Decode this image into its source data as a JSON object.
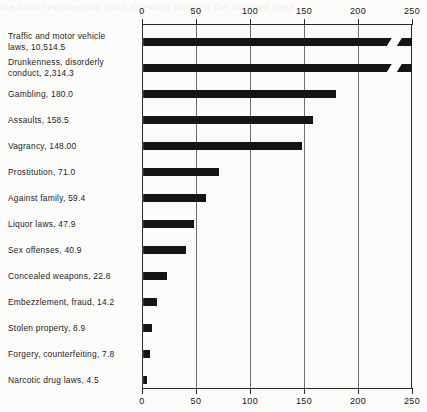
{
  "scan": {
    "bleed_text": "the faint reverse-side print showing through the scanned page"
  },
  "chart_data": {
    "type": "bar",
    "orientation": "horizontal",
    "title": "",
    "xlabel": "",
    "ylabel": "",
    "xlim": [
      0,
      250
    ],
    "ticks": [
      0,
      50,
      100,
      150,
      200,
      250
    ],
    "tick_labels": [
      "0",
      "50",
      "100",
      "150",
      "200",
      "250"
    ],
    "grid": true,
    "grid_axis": "x",
    "axes_shown": [
      "top",
      "bottom"
    ],
    "legend": "none",
    "note": "Two longest bars are truncated with a break mark; their true values exceed the 250 axis maximum.",
    "categories": [
      "Traffic and motor vehicle laws",
      "Drunkenness, disorderly conduct",
      "Gambling",
      "Assaults",
      "Vagrancy",
      "Prostitution",
      "Against family",
      "Liquor laws",
      "Sex offenses",
      "Concealed weapons",
      "Embezzlement, fraud",
      "Stolen property",
      "Forgery, counterfeiting",
      "Narcotic drug laws"
    ],
    "values": [
      10514.5,
      2314.3,
      180.0,
      158.5,
      148.0,
      71.0,
      59.4,
      47.9,
      40.9,
      22.8,
      14.2,
      8.9,
      7.8,
      4.5
    ],
    "value_labels": [
      "10,514.5",
      "2,314.3",
      "180.0",
      "158.5",
      "148.00",
      "71.0",
      "59.4",
      "47.9",
      "40.9",
      "22.8",
      "14.2",
      "8.9",
      "7.8",
      "4.5"
    ],
    "bars": [
      {
        "label": "Traffic and motor vehicle\nlaws, 10,514.5",
        "value": 10514.5,
        "drawn": 250,
        "truncated": true
      },
      {
        "label": "Drunkenness, disorderly\nconduct, 2,314.3",
        "value": 2314.3,
        "drawn": 250,
        "truncated": true
      },
      {
        "label": "Gambling, 180.0",
        "value": 180.0,
        "drawn": 180.0,
        "truncated": false
      },
      {
        "label": "Assaults, 158.5",
        "value": 158.5,
        "drawn": 158.5,
        "truncated": false
      },
      {
        "label": "Vagrancy, 148.00",
        "value": 148.0,
        "drawn": 148.0,
        "truncated": false
      },
      {
        "label": "Prostitution, 71.0",
        "value": 71.0,
        "drawn": 71.0,
        "truncated": false
      },
      {
        "label": "Against family, 59.4",
        "value": 59.4,
        "drawn": 59.4,
        "truncated": false
      },
      {
        "label": "Liquor laws, 47.9",
        "value": 47.9,
        "drawn": 47.9,
        "truncated": false
      },
      {
        "label": "Sex offenses, 40.9",
        "value": 40.9,
        "drawn": 40.9,
        "truncated": false
      },
      {
        "label": "Concealed weapons, 22.8",
        "value": 22.8,
        "drawn": 22.8,
        "truncated": false
      },
      {
        "label": "Embezzlement, fraud, 14.2",
        "value": 14.2,
        "drawn": 14.2,
        "truncated": false
      },
      {
        "label": "Stolen property, 8.9",
        "value": 8.9,
        "drawn": 8.9,
        "truncated": false
      },
      {
        "label": "Forgery, counterfeiting, 7.8",
        "value": 7.8,
        "drawn": 7.8,
        "truncated": false
      },
      {
        "label": "Narcotic drug laws, 4.5",
        "value": 4.5,
        "drawn": 4.5,
        "truncated": false
      }
    ],
    "colors": {
      "bar": "#151515",
      "axis": "#2b2b2b",
      "grid": "#6e6e6e",
      "background": "#fbfbfa",
      "text": "#161616"
    }
  }
}
